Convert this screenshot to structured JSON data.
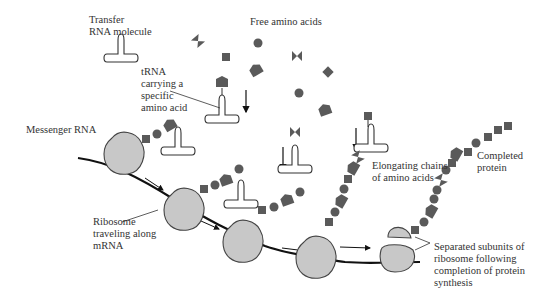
{
  "colors": {
    "amino_acid": "#5a5a5a",
    "ribosome_fill": "#c8c8c8",
    "ribosome_stroke": "#444444",
    "line": "#111111",
    "text": "#333333"
  },
  "labels": {
    "transfer_rna": [
      "Transfer",
      "RNA molecule"
    ],
    "free_amino_acids": [
      "Free amino acids"
    ],
    "trna_carrying": [
      "tRNA",
      "carrying a",
      "specific",
      "amino acid"
    ],
    "messenger_rna": [
      "Messenger RNA"
    ],
    "ribosome_traveling": [
      "Ribosome",
      "traveling along",
      "mRNA"
    ],
    "elongating_chains": [
      "Elongating chains",
      "of amino acids"
    ],
    "completed_protein": [
      "Completed",
      "protein"
    ],
    "separated_subunits": [
      "Separated subunits of",
      "ribosome following",
      "completion of protein",
      "synthesis"
    ]
  },
  "amino_acid_shapes": [
    "circle",
    "square",
    "diamond",
    "bowtie",
    "pentagon-tag"
  ]
}
